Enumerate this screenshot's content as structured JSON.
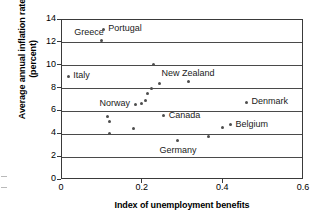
{
  "chart_data": {
    "type": "scatter",
    "title": "",
    "xlabel": "Index of unemployment benefits",
    "ylabel": "Average annual inflation rate (percent)",
    "xlim": [
      0,
      0.6
    ],
    "ylim": [
      0,
      14
    ],
    "xticks": [
      "0",
      "0.2",
      "0.4",
      "0.6"
    ],
    "xtick_values": [
      0,
      0.2,
      0.4,
      0.6
    ],
    "yticks": [
      "0",
      "2",
      "4",
      "6",
      "8",
      "10",
      "12",
      "14"
    ],
    "ytick_values": [
      0,
      2,
      4,
      6,
      8,
      10,
      12,
      14
    ],
    "grid": "horizontal",
    "legend": "none",
    "points": [
      {
        "label": "Portugal",
        "x": 0.105,
        "y": 13.1,
        "label_pos": "right"
      },
      {
        "label": "Greece",
        "x": 0.1,
        "y": 12.1,
        "label_pos": "left-above"
      },
      {
        "label": "",
        "x": 0.23,
        "y": 10.0,
        "label_pos": "none"
      },
      {
        "label": "Italy",
        "x": 0.018,
        "y": 9.0,
        "label_pos": "right"
      },
      {
        "label": "New Zealand",
        "x": 0.315,
        "y": 8.5,
        "label_pos": "above"
      },
      {
        "label": "",
        "x": 0.245,
        "y": 8.4,
        "label_pos": "none"
      },
      {
        "label": "",
        "x": 0.225,
        "y": 7.95,
        "label_pos": "none"
      },
      {
        "label": "",
        "x": 0.215,
        "y": 7.5,
        "label_pos": "none"
      },
      {
        "label": "",
        "x": 0.21,
        "y": 6.85,
        "label_pos": "none"
      },
      {
        "label": "",
        "x": 0.2,
        "y": 6.65,
        "label_pos": "none"
      },
      {
        "label": "Norway",
        "x": 0.185,
        "y": 6.55,
        "label_pos": "left"
      },
      {
        "label": "Denmark",
        "x": 0.46,
        "y": 6.7,
        "label_pos": "right"
      },
      {
        "label": "Canada",
        "x": 0.255,
        "y": 5.55,
        "label_pos": "right"
      },
      {
        "label": "",
        "x": 0.115,
        "y": 5.5,
        "label_pos": "none"
      },
      {
        "label": "",
        "x": 0.12,
        "y": 5.05,
        "label_pos": "none"
      },
      {
        "label": "Belgium",
        "x": 0.42,
        "y": 4.75,
        "label_pos": "right"
      },
      {
        "label": "",
        "x": 0.4,
        "y": 4.5,
        "label_pos": "none"
      },
      {
        "label": "",
        "x": 0.18,
        "y": 4.4,
        "label_pos": "none"
      },
      {
        "label": "",
        "x": 0.12,
        "y": 4.0,
        "label_pos": "none"
      },
      {
        "label": "",
        "x": 0.365,
        "y": 3.7,
        "label_pos": "none"
      },
      {
        "label": "Germany",
        "x": 0.29,
        "y": 3.4,
        "label_pos": "below"
      }
    ]
  },
  "axes": {
    "x_title": "Index of unemployment benefits",
    "y_title": "Average annual inflation rate (percent)"
  },
  "marker_color": "#4d4d4d",
  "axis_color": "#3a3a3a"
}
